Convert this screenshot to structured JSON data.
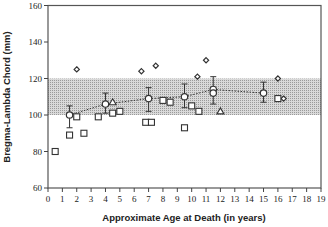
{
  "chart_data": {
    "type": "scatter",
    "title": "",
    "xlabel": "Approximate Age at Death (in years)",
    "ylabel": "Bregma-Lambda Chord (mm)",
    "xlim": [
      0,
      19
    ],
    "ylim": [
      60,
      160
    ],
    "xticks": [
      0,
      1,
      2,
      3,
      4,
      5,
      6,
      7,
      8,
      9,
      10,
      11,
      12,
      13,
      14,
      15,
      16,
      17,
      18,
      19
    ],
    "yticks": [
      60,
      80,
      100,
      120,
      140,
      160
    ],
    "grid": false,
    "legend": null,
    "reference_band": {
      "ymin": 100,
      "ymax": 120,
      "fill": "#c8c8c8",
      "pattern": "stippled"
    },
    "series": [
      {
        "name": "means",
        "marker": "circle",
        "line": "dotted",
        "points": [
          {
            "x": 1.5,
            "y": 100,
            "err_low": 93,
            "err_high": 105
          },
          {
            "x": 4.0,
            "y": 106,
            "err_low": 101,
            "err_high": 112
          },
          {
            "x": 7.0,
            "y": 109,
            "err_low": 102,
            "err_high": 115
          },
          {
            "x": 9.5,
            "y": 110,
            "err_low": 104,
            "err_high": 117
          },
          {
            "x": 11.5,
            "y": 114,
            "err_low": 106,
            "err_high": 121
          },
          {
            "x": 11.5,
            "y": 112,
            "err_low": null,
            "err_high": null
          },
          {
            "x": 15.0,
            "y": 112,
            "err_low": 107,
            "err_high": 118
          }
        ]
      },
      {
        "name": "diamonds",
        "marker": "diamond",
        "points": [
          {
            "x": 2.0,
            "y": 125
          },
          {
            "x": 6.5,
            "y": 124
          },
          {
            "x": 7.5,
            "y": 127
          },
          {
            "x": 10.4,
            "y": 121
          },
          {
            "x": 11.0,
            "y": 130
          },
          {
            "x": 16.0,
            "y": 120
          },
          {
            "x": 16.4,
            "y": 109
          }
        ]
      },
      {
        "name": "squares",
        "marker": "square",
        "points": [
          {
            "x": 0.5,
            "y": 80
          },
          {
            "x": 1.5,
            "y": 89
          },
          {
            "x": 2.0,
            "y": 99
          },
          {
            "x": 2.5,
            "y": 90
          },
          {
            "x": 3.5,
            "y": 99
          },
          {
            "x": 4.5,
            "y": 101
          },
          {
            "x": 5.0,
            "y": 102
          },
          {
            "x": 6.8,
            "y": 96
          },
          {
            "x": 7.2,
            "y": 96
          },
          {
            "x": 8.0,
            "y": 108
          },
          {
            "x": 8.5,
            "y": 107
          },
          {
            "x": 9.5,
            "y": 93
          },
          {
            "x": 10.0,
            "y": 105
          },
          {
            "x": 10.5,
            "y": 102
          },
          {
            "x": 16.0,
            "y": 109
          }
        ]
      },
      {
        "name": "triangles",
        "marker": "triangle",
        "points": [
          {
            "x": 4.5,
            "y": 107
          },
          {
            "x": 12.0,
            "y": 102
          }
        ]
      }
    ]
  },
  "labels": {
    "x_axis_title": "Approximate Age at Death (in years)",
    "y_axis_title": "Bregma-Lambda Chord (mm)"
  }
}
